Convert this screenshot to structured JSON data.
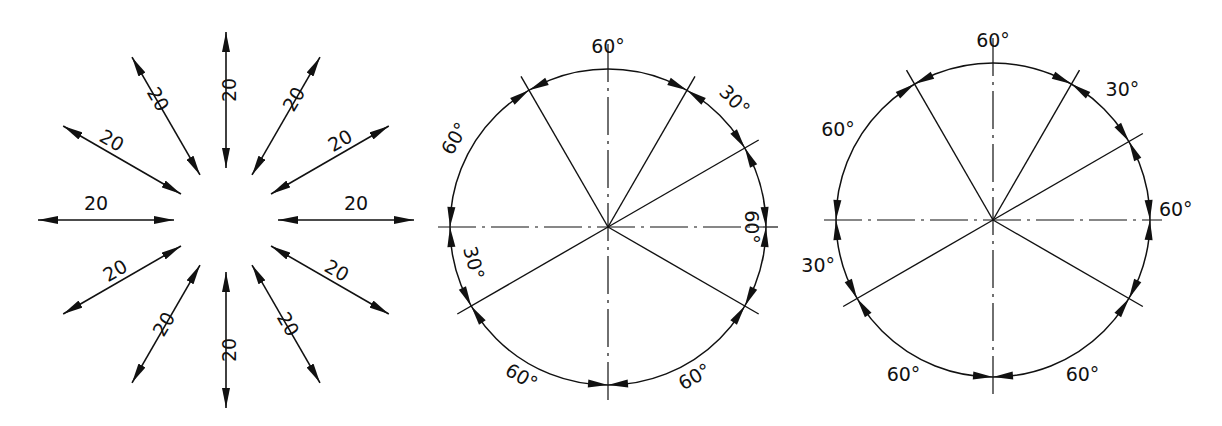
{
  "figures": [
    {
      "id": "radial-linear-dimensions",
      "description": "Twelve linear dimensions arranged radially every 30 degrees",
      "labels": [
        "20",
        "20",
        "20",
        "20",
        "20",
        "20",
        "20",
        "20",
        "20",
        "20",
        "20",
        "20"
      ]
    },
    {
      "id": "angular-dimensions-aligned",
      "description": "Circle with angular dimensions, text aligned to arc",
      "labels": {
        "top": "60°",
        "upper_right": "30°",
        "right": "60°",
        "lower_right": "60°",
        "bottom_left": "60°",
        "left_lower": "30°",
        "left_upper": "60°"
      }
    },
    {
      "id": "angular-dimensions-horizontal",
      "description": "Circle with angular dimensions, text horizontal",
      "labels": {
        "top": "60°",
        "upper_right": "30°",
        "right": "60°",
        "lower_right": "60°",
        "bottom_left": "60°",
        "left_lower": "30°",
        "left_upper": "60°"
      }
    }
  ],
  "colors": {
    "line": "#111111",
    "background": "#ffffff"
  }
}
